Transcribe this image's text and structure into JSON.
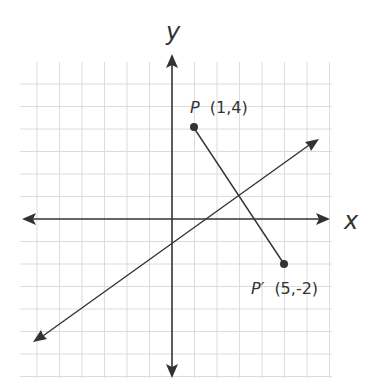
{
  "figure": {
    "type": "coordinate-plane-reflection",
    "axes": {
      "x_label": "x",
      "y_label": "y"
    },
    "grid": {
      "x_min": -6,
      "x_max": 7,
      "y_min": -7,
      "y_max": 6,
      "unit_px": 22.5
    },
    "points": [
      {
        "name": "P",
        "coords": "(1,4)",
        "x": 1,
        "y": 4
      },
      {
        "name": "P′",
        "coords": "(5,-2)",
        "x": 5,
        "y": -2
      }
    ],
    "segment": {
      "from": "P",
      "to": "P′"
    },
    "line_of_reflection": {
      "description": "line through midpoint (3,1) perpendicular to PP′",
      "slope": 0.6667,
      "y_intercept": -1
    },
    "colors": {
      "ink": "#333333",
      "grid": "#dcdcdc",
      "background": "#ffffff"
    }
  }
}
